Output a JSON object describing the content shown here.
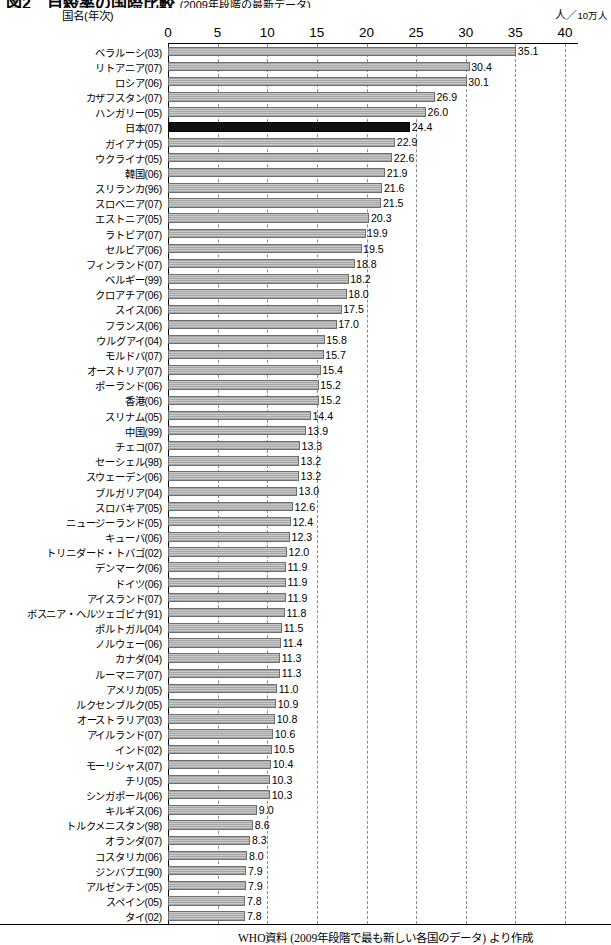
{
  "title": {
    "number": "図2",
    "main": "自殺率の国際比較",
    "sub": "(2009年段階の最新データ)"
  },
  "axis_caption": "国名(年次)",
  "unit_label_prefix": "人",
  "unit_label_slash": "／",
  "unit_label_suffix": "10万人",
  "footer": "WHO資料 (2009年段階で最も新しい各国のデータ) より作成",
  "chart_data": {
    "type": "bar",
    "orientation": "horizontal",
    "title": "図2 自殺率の国際比較 (2009年段階の最新データ)",
    "xlabel": "人／10万人",
    "ylabel": "国名(年次)",
    "xlim": [
      0,
      40
    ],
    "xticks": [
      0,
      5,
      10,
      15,
      20,
      25,
      30,
      35,
      40
    ],
    "grid": true,
    "legend": false,
    "highlight_category": "日本(07)",
    "highlight_color": "#111111",
    "bar_color": "#c0c0c0",
    "source_note": "WHO資料 (2009年段階で最も新しい各国のデータ) より作成",
    "categories": [
      "ベラルーシ(03)",
      "リトアニア(07)",
      "ロシア(06)",
      "カザフスタン(07)",
      "ハンガリー(05)",
      "日本(07)",
      "ガイアナ(05)",
      "ウクライナ(05)",
      "韓国(06)",
      "スリランカ(96)",
      "スロベニア(07)",
      "エストニア(05)",
      "ラトビア(07)",
      "セルビア(06)",
      "フィンランド(07)",
      "ベルギー(99)",
      "クロアチア(06)",
      "スイス(06)",
      "フランス(06)",
      "ウルグアイ(04)",
      "モルドバ(07)",
      "オーストリア(07)",
      "ポーランド(06)",
      "香港(06)",
      "スリナム(05)",
      "中国(99)",
      "チェコ(07)",
      "セーシェル(98)",
      "スウェーデン(06)",
      "ブルガリア(04)",
      "スロバキア(05)",
      "ニュージーランド(05)",
      "キューバ(06)",
      "トリニダード・トバゴ(02)",
      "デンマーク(06)",
      "ドイツ(06)",
      "アイスランド(07)",
      "ボスニア・ヘルツェゴビナ(91)",
      "ポルトガル(04)",
      "ノルウェー(06)",
      "カナダ(04)",
      "ルーマニア(07)",
      "アメリカ(05)",
      "ルクセンブルク(05)",
      "オーストラリア(03)",
      "アイルランド(07)",
      "インド(02)",
      "モーリシャス(07)",
      "チリ(05)",
      "シンガポール(06)",
      "キルギス(06)",
      "トルクメニスタン(98)",
      "オランダ(07)",
      "コスタリカ(06)",
      "ジンバブエ(90)",
      "アルゼンチン(05)",
      "スペイン(05)",
      "タイ(02)"
    ],
    "values": [
      35.1,
      30.4,
      30.1,
      26.9,
      26.0,
      24.4,
      22.9,
      22.6,
      21.9,
      21.6,
      21.5,
      20.3,
      19.9,
      19.5,
      18.8,
      18.2,
      18.0,
      17.5,
      17.0,
      15.8,
      15.7,
      15.4,
      15.2,
      15.2,
      14.4,
      13.9,
      13.3,
      13.2,
      13.2,
      13.0,
      12.6,
      12.4,
      12.3,
      12.0,
      11.9,
      11.9,
      11.9,
      11.8,
      11.5,
      11.4,
      11.3,
      11.3,
      11.0,
      10.9,
      10.8,
      10.6,
      10.5,
      10.4,
      10.3,
      10.3,
      9.0,
      8.6,
      8.3,
      8.0,
      7.9,
      7.9,
      7.8,
      7.8
    ],
    "value_labels": [
      "35.1",
      "30.4",
      "30.1",
      "26.9",
      "26.0",
      "24.4",
      "22.9",
      "22.6",
      "21.9",
      "21.6",
      "21.5",
      "20.3",
      "19.9",
      "19.5",
      "18.8",
      "18.2",
      "18.0",
      "17.5",
      "17.0",
      "15.8",
      "15.7",
      "15.4",
      "15.2",
      "15.2",
      "14.4",
      "13.9",
      "13.3",
      "13.2",
      "13.2",
      "13.0",
      "12.6",
      "12.4",
      "12.3",
      "12.0",
      "11.9",
      "11.9",
      "11.9",
      "11.8",
      "11.5",
      "11.4",
      "11.3",
      "11.3",
      "11.0",
      "10.9",
      "10.8",
      "10.6",
      "10.5",
      "10.4",
      "10.3",
      "10.3",
      "9.0",
      "8.6",
      "8.3",
      "8.0",
      "7.9",
      "7.9",
      "7.8",
      "7.8"
    ]
  }
}
